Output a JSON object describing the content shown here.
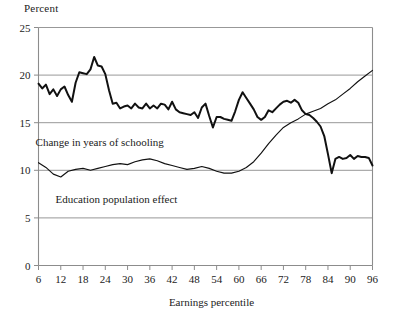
{
  "chart_data": {
    "type": "line",
    "title": "",
    "xlabel": "Earnings percentile",
    "ylabel": "Percent",
    "ylabel_position": "top-left",
    "xlim": [
      6,
      96
    ],
    "ylim": [
      0,
      25
    ],
    "xticks": [
      6,
      12,
      18,
      24,
      30,
      36,
      42,
      48,
      54,
      60,
      66,
      72,
      78,
      84,
      90,
      96
    ],
    "yticks": [
      0,
      5,
      10,
      15,
      20,
      25
    ],
    "grid": "horizontal",
    "grid_color": "#8c8c8c",
    "axis_color": "#8c8c8c",
    "line_color": "#111111",
    "legend": "inline-annotations",
    "annotations": [
      {
        "text": "Change in years of schooling",
        "x": 22.5,
        "y": 12.6
      },
      {
        "text": "Education population effect",
        "x": 27.0,
        "y": 6.6
      }
    ],
    "series": [
      {
        "name": "Change in years of schooling",
        "style": "jagged-thick",
        "x": [
          6,
          7,
          8,
          9,
          10,
          11,
          12,
          13,
          14,
          15,
          16,
          17,
          18,
          19,
          20,
          21,
          22,
          23,
          24,
          25,
          26,
          27,
          28,
          29,
          30,
          31,
          32,
          33,
          34,
          35,
          36,
          37,
          38,
          39,
          40,
          41,
          42,
          43,
          44,
          45,
          46,
          47,
          48,
          49,
          50,
          51,
          52,
          53,
          54,
          55,
          56,
          57,
          58,
          59,
          60,
          61,
          62,
          63,
          64,
          65,
          66,
          67,
          68,
          69,
          70,
          71,
          72,
          73,
          74,
          75,
          76,
          77,
          78,
          79,
          80,
          81,
          82,
          83,
          84,
          85,
          86,
          87,
          88,
          89,
          90,
          91,
          92,
          93,
          94,
          95,
          96
        ],
        "values": [
          19.1,
          18.6,
          19.0,
          18.0,
          18.5,
          17.8,
          18.5,
          18.8,
          17.9,
          17.2,
          19.2,
          20.3,
          20.2,
          20.1,
          20.6,
          21.9,
          21.0,
          20.9,
          20.1,
          18.4,
          17.0,
          17.1,
          16.5,
          16.7,
          16.8,
          16.5,
          17.0,
          16.6,
          16.5,
          17.0,
          16.5,
          16.8,
          16.5,
          17.0,
          16.9,
          16.4,
          17.2,
          16.4,
          16.1,
          16.0,
          15.9,
          15.8,
          16.1,
          15.5,
          16.6,
          17.0,
          15.7,
          14.5,
          15.6,
          15.6,
          15.4,
          15.3,
          15.2,
          16.2,
          17.4,
          18.2,
          17.6,
          17.0,
          16.4,
          15.6,
          15.3,
          15.6,
          16.3,
          16.1,
          16.5,
          16.9,
          17.2,
          17.3,
          17.1,
          17.4,
          17.1,
          16.3,
          15.9,
          15.8,
          15.5,
          15.1,
          14.6,
          13.6,
          11.7,
          9.7,
          11.2,
          11.4,
          11.2,
          11.3,
          11.6,
          11.2,
          11.5,
          11.4,
          11.4,
          11.3,
          10.5
        ]
      },
      {
        "name": "Education population effect",
        "style": "smooth-thin",
        "x": [
          6,
          8,
          10,
          12,
          14,
          16,
          18,
          20,
          22,
          24,
          26,
          28,
          30,
          32,
          34,
          36,
          38,
          40,
          42,
          44,
          46,
          48,
          50,
          52,
          54,
          56,
          58,
          60,
          62,
          64,
          66,
          68,
          70,
          72,
          74,
          76,
          78,
          80,
          82,
          84,
          86,
          88,
          90,
          92,
          94,
          96
        ],
        "values": [
          10.8,
          10.3,
          9.6,
          9.3,
          9.9,
          10.1,
          10.2,
          10.0,
          10.2,
          10.4,
          10.6,
          10.7,
          10.6,
          10.9,
          11.1,
          11.2,
          11.0,
          10.7,
          10.5,
          10.3,
          10.1,
          10.2,
          10.4,
          10.2,
          9.9,
          9.7,
          9.7,
          9.9,
          10.3,
          10.9,
          11.8,
          12.8,
          13.7,
          14.5,
          15.0,
          15.4,
          15.9,
          16.2,
          16.5,
          17.0,
          17.4,
          18.0,
          18.6,
          19.3,
          19.9,
          20.5
        ]
      }
    ]
  },
  "axis": {
    "percent_label": "Percent",
    "x_title": "Earnings percentile"
  }
}
